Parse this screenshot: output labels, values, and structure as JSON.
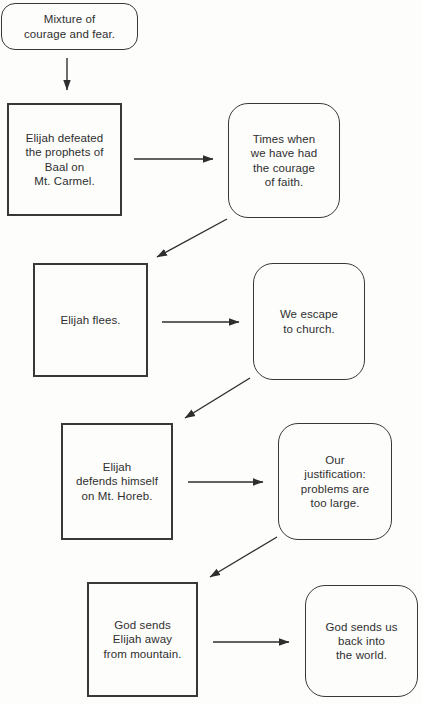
{
  "page": {
    "background_color": "#fdfdfc",
    "ink_color": "#383838"
  },
  "diagram": {
    "nodes": {
      "mixture": {
        "label": "Mixture of\ncourage and fear.",
        "shape": "rounded"
      },
      "defeated": {
        "label": "Elijah defeated\nthe prophets of\nBaal on\nMt. Carmel.",
        "shape": "square"
      },
      "courage": {
        "label": "Times when\nwe have had\nthe courage\nof faith.",
        "shape": "rounded"
      },
      "flees": {
        "label": "Elijah flees.",
        "shape": "square"
      },
      "escape": {
        "label": "We escape\nto church.",
        "shape": "rounded"
      },
      "defends": {
        "label": "Elijah\ndefends himself\non Mt. Horeb.",
        "shape": "square"
      },
      "justification": {
        "label": "Our\njustification:\nproblems are\ntoo large.",
        "shape": "rounded"
      },
      "sends_away": {
        "label": "God sends\nElijah away\nfrom mountain.",
        "shape": "square"
      },
      "sends_back": {
        "label": "God sends us\nback into\nthe world.",
        "shape": "rounded"
      }
    },
    "edges": [
      {
        "from": "mixture",
        "to": "defeated"
      },
      {
        "from": "defeated",
        "to": "courage"
      },
      {
        "from": "courage",
        "to": "flees"
      },
      {
        "from": "flees",
        "to": "escape"
      },
      {
        "from": "escape",
        "to": "defends"
      },
      {
        "from": "defends",
        "to": "justification"
      },
      {
        "from": "justification",
        "to": "sends_away"
      },
      {
        "from": "sends_away",
        "to": "sends_back"
      }
    ]
  }
}
